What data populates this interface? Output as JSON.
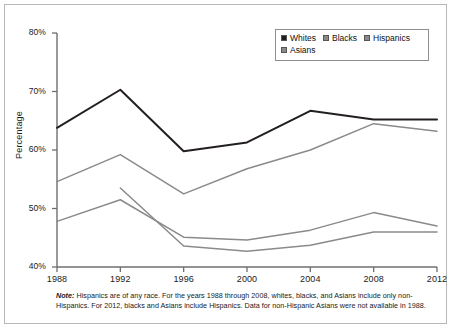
{
  "chart_data": {
    "type": "line",
    "title": "",
    "xlabel": "",
    "ylabel": "Percentage",
    "categories": [
      "1988",
      "1992",
      "1996",
      "2000",
      "2004",
      "2008",
      "2012"
    ],
    "x": [
      1988,
      1992,
      1996,
      2000,
      2004,
      2008,
      2012
    ],
    "ylim": [
      40,
      80
    ],
    "xlim": [
      1988,
      2012
    ],
    "yticks": [
      "40%",
      "50%",
      "60%",
      "70%",
      "80%"
    ],
    "ytick_values": [
      40,
      50,
      60,
      70,
      80
    ],
    "grid": false,
    "legend_position": "top-right",
    "series": [
      {
        "name": "Whites",
        "color": "#231f20",
        "values": [
          63.8,
          70.3,
          59.8,
          61.3,
          66.7,
          65.2,
          65.2
        ]
      },
      {
        "name": "Blacks",
        "color": "#8a8a8a",
        "values": [
          54.6,
          59.2,
          52.5,
          56.8,
          60.0,
          64.5,
          63.2
        ]
      },
      {
        "name": "Hispanics",
        "color": "#8a8a8a",
        "values": [
          47.8,
          51.5,
          45.1,
          44.6,
          46.3,
          49.3,
          47.0
        ]
      },
      {
        "name": "Asians",
        "color": "#8a8a8a",
        "values": [
          null,
          53.5,
          43.6,
          42.7,
          43.7,
          46.0,
          46.0
        ]
      }
    ]
  },
  "legend": {
    "items": [
      {
        "label": "Whites",
        "swatch": "#231f20"
      },
      {
        "label": "Blacks",
        "swatch": "#8a8a8a"
      },
      {
        "label": "Hispanics",
        "swatch": "#8a8a8a"
      },
      {
        "label": "Asians",
        "swatch": "#8a8a8a"
      }
    ]
  },
  "note": {
    "prefix": "Note:",
    "text": " Hispanics are of any race. For the years 1988 through 2008, whites, blacks, and Asians include only non-Hispanics. For 2012, blacks and Asians include Hispanics. Data for non-Hispanic Asians were not available in 1988."
  },
  "axis": {
    "y_label": "Percentage",
    "y_ticks": [
      "80%",
      "70%",
      "60%",
      "50%",
      "40%"
    ],
    "x_ticks": [
      "1988",
      "1992",
      "1996",
      "2000",
      "2004",
      "2008",
      "2012"
    ]
  },
  "colors": {
    "line_dark": "#231f20",
    "line_gray": "#8a8a8a",
    "axis": "#6f6f6f",
    "frame": "#b8b8b8",
    "text": "#1a1a1a"
  }
}
